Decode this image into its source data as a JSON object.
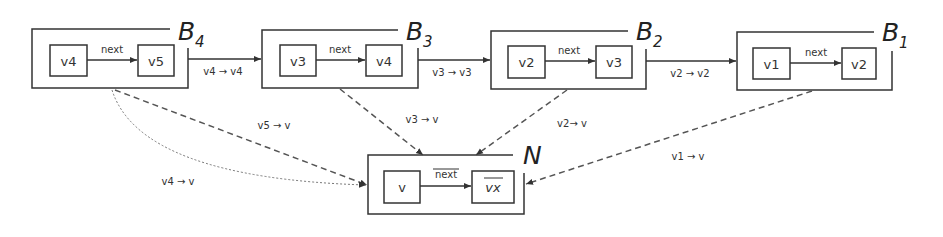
{
  "blocks": [
    {
      "name": "B",
      "sub": "4",
      "left": "v4",
      "right": "v5",
      "edge": "next"
    },
    {
      "name": "B",
      "sub": "3",
      "left": "v3",
      "right": "v4",
      "edge": "next"
    },
    {
      "name": "B",
      "sub": "2",
      "left": "v2",
      "right": "v3",
      "edge": "next"
    },
    {
      "name": "B",
      "sub": "1",
      "left": "v1",
      "right": "v2",
      "edge": "next"
    }
  ],
  "merged": {
    "name": "N",
    "left": "v",
    "right": "vx",
    "edge": "next"
  },
  "chain_edges": [
    "v4 → v4",
    "v3 → v3",
    "v2 → v2"
  ],
  "merge_edges": {
    "v5": "v5 → v",
    "v4": "v4 → v",
    "v3": "v3 → v",
    "v2": "v2→ v",
    "v1": "v1 → v"
  }
}
